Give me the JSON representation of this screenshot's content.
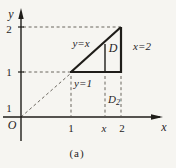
{
  "figure": {
    "caption": "(a)",
    "colors": {
      "paper": "#f6f5f1",
      "ink": "#1f1d19",
      "dash": "#6b675f"
    },
    "axes": {
      "y_axis_label": "y",
      "x_axis_label": "x",
      "origin_label": "O"
    },
    "y_ticks": {
      "t2": "2",
      "t1": "1",
      "t_low": "1"
    },
    "x_ticks": {
      "t1": "1",
      "tx": "x",
      "t2": "2"
    },
    "labels": {
      "diagonal_line": "y=x",
      "right_line": "x=2",
      "bottom_line": "y=1",
      "region": "D",
      "strip_base": "D",
      "strip_sub": "2"
    },
    "geometry": {
      "region_bounds": [
        "y=x",
        "y=1",
        "x=2"
      ],
      "triangle_vertices": [
        [
          1,
          1
        ],
        [
          2,
          1
        ],
        [
          2,
          2
        ]
      ],
      "slice_at": "x",
      "x_range": [
        1,
        2
      ],
      "y_range": [
        1,
        2
      ]
    }
  }
}
